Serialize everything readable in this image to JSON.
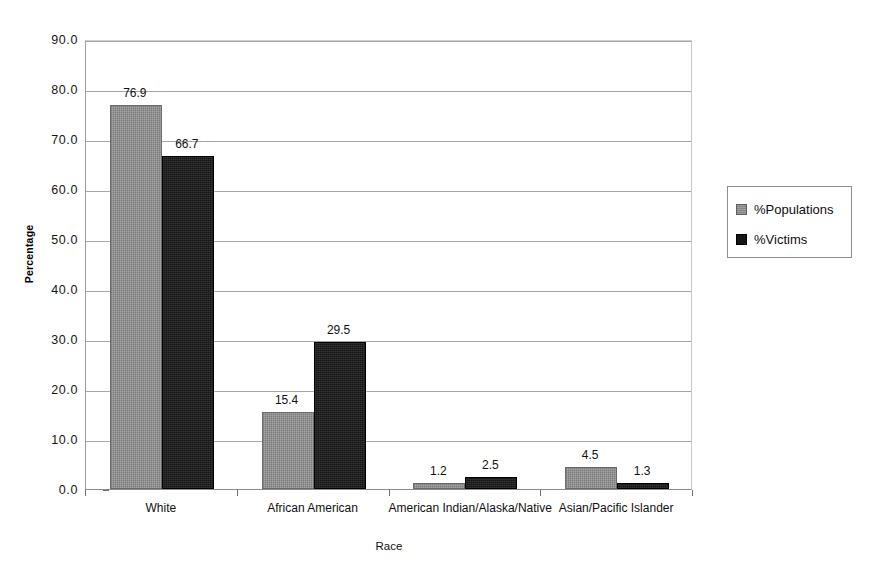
{
  "chart_data": {
    "type": "bar",
    "title": "",
    "xlabel": "Race",
    "ylabel": "Percentage",
    "categories": [
      "White",
      "African American",
      "American Indian/Alaska/Native",
      "Asian/Pacific Islander"
    ],
    "series": [
      {
        "name": "%Populations",
        "color": "#878787",
        "values": [
          76.9,
          15.4,
          1.2,
          4.5
        ]
      },
      {
        "name": "%Victims",
        "color": "#161616",
        "values": [
          66.7,
          29.5,
          2.5,
          1.3
        ]
      }
    ],
    "ylim": [
      0.0,
      90.0
    ],
    "ytick_step": 10.0,
    "ytick_labels": [
      "90.0",
      "80.0",
      "70.0",
      "60.0",
      "50.0",
      "40.0",
      "30.0",
      "20.0",
      "10.0",
      "0.0"
    ],
    "ytick_values": [
      90.0,
      80.0,
      70.0,
      60.0,
      50.0,
      40.0,
      30.0,
      20.0,
      10.0,
      0.0
    ],
    "grid": true,
    "grid_axis": "y",
    "legend_position": "right",
    "data_labels": true,
    "data_label_values": [
      "76.9",
      "66.7",
      "15.4",
      "29.5",
      "1.2",
      "2.5",
      "4.5",
      "1.3"
    ]
  },
  "legend": {
    "items": [
      {
        "label": "%Populations",
        "swatch": "series-pop"
      },
      {
        "label": "%Victims",
        "swatch": "series-vic"
      }
    ]
  },
  "axes": {
    "x_title": "Race",
    "y_title": "Percentage"
  }
}
